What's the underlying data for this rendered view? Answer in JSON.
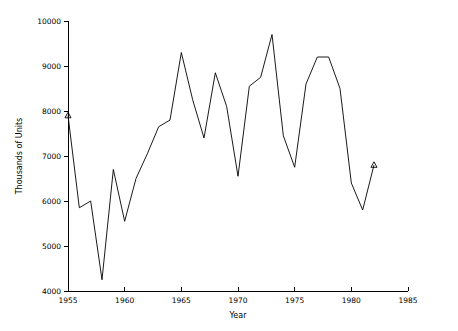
{
  "chart_data": {
    "type": "line",
    "title": "",
    "subtitle": "",
    "xlabel": "Year",
    "ylabel": "Thousands of Units",
    "xlim": [
      1955,
      1985
    ],
    "ylim": [
      4000,
      10000
    ],
    "xticks": [
      1955,
      1960,
      1965,
      1970,
      1975,
      1980,
      1985
    ],
    "xtick_labels": [
      "1955",
      "1960",
      "1965",
      "1970",
      "1975",
      "1980",
      "1985"
    ],
    "yticks": [
      4000,
      5000,
      6000,
      7000,
      8000,
      9000,
      10000
    ],
    "ytick_labels": [
      "4000",
      "5000",
      "6000",
      "7000",
      "8000",
      "9000",
      "10000"
    ],
    "grid": false,
    "legend": false,
    "legend_position": "none",
    "line_color": "#000000",
    "marker_symbol": "triangle",
    "marker_points": [
      {
        "x": 1955,
        "y": 7900
      },
      {
        "x": 1982,
        "y": 6800
      }
    ],
    "x": [
      1955,
      1956,
      1957,
      1958,
      1959,
      1960,
      1961,
      1962,
      1963,
      1964,
      1965,
      1966,
      1967,
      1968,
      1969,
      1970,
      1971,
      1972,
      1973,
      1974,
      1975,
      1976,
      1977,
      1978,
      1979,
      1980,
      1981,
      1982
    ],
    "series": [
      {
        "name": "Units",
        "values": [
          7900,
          5850,
          6000,
          4250,
          6700,
          5550,
          6500,
          7050,
          7650,
          7800,
          9300,
          8250,
          7400,
          8850,
          8100,
          6550,
          8550,
          8750,
          9700,
          7450,
          6750,
          8600,
          9200,
          9200,
          8500,
          6400,
          5800,
          6800
        ]
      }
    ],
    "annotations": []
  },
  "axes": {
    "y_axis_name": "y-axis",
    "x_axis_name": "x-axis"
  }
}
